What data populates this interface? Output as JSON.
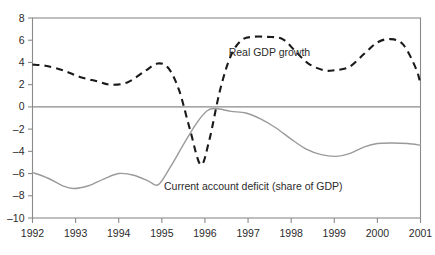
{
  "chart_data": {
    "type": "line",
    "title": "",
    "subtitle": "",
    "xlabel": "",
    "ylabel": "",
    "xlim": [
      1992,
      2001
    ],
    "ylim": [
      -10,
      8
    ],
    "grid": false,
    "legend_position": "inline-annotation",
    "y_ticks": [
      8,
      6,
      4,
      2,
      0,
      -2,
      -4,
      -6,
      -8,
      -10
    ],
    "y_tick_labels": [
      "8",
      "6",
      "4",
      "2",
      "0",
      "-2",
      "-4",
      "-6",
      "-8",
      "-10"
    ],
    "x_ticks": [
      1992,
      1993,
      1994,
      1995,
      1996,
      1997,
      1998,
      1999,
      2000,
      2001
    ],
    "x_tick_labels": [
      "1992",
      "1993",
      "1994",
      "1995",
      "1996",
      "1997",
      "1998",
      "1999",
      "2000",
      "2001"
    ],
    "zero_line": 0,
    "series": [
      {
        "name": "Real GDP growth",
        "style": "dashed",
        "color": "#1a1a1a",
        "label_position": {
          "x": 1996.55,
          "y": 4.55
        },
        "x": [
          1992.0,
          1992.3,
          1992.7,
          1993.1,
          1993.5,
          1993.8,
          1994.2,
          1994.6,
          1994.9,
          1995.15,
          1995.4,
          1995.65,
          1995.9,
          1996.1,
          1996.35,
          1996.6,
          1996.85,
          1997.1,
          1997.45,
          1997.8,
          1998.1,
          1998.4,
          1998.75,
          1999.0,
          1999.35,
          1999.7,
          2000.0,
          2000.3,
          2000.6,
          2000.9,
          2001.0
        ],
        "y": [
          3.8,
          3.7,
          3.3,
          2.7,
          2.3,
          2.0,
          2.2,
          3.2,
          3.9,
          3.5,
          1.5,
          -2.0,
          -5.2,
          -3.0,
          1.5,
          4.6,
          6.0,
          6.3,
          6.3,
          6.1,
          5.0,
          3.9,
          3.3,
          3.3,
          3.6,
          4.8,
          5.8,
          6.1,
          5.6,
          3.4,
          2.0
        ]
      },
      {
        "name": "Current account deficit (share of GDP)",
        "style": "solid",
        "color": "#9a9a9a",
        "label_position": {
          "x": 1995.05,
          "y": -7.45
        },
        "x": [
          1992.0,
          1992.35,
          1992.7,
          1992.95,
          1993.3,
          1993.65,
          1994.0,
          1994.35,
          1994.7,
          1994.92,
          1995.2,
          1995.5,
          1995.8,
          1996.05,
          1996.25,
          1996.6,
          1996.95,
          1997.3,
          1997.65,
          1998.0,
          1998.35,
          1998.7,
          1999.05,
          1999.35,
          1999.7,
          2000.0,
          2000.35,
          2000.7,
          2001.0
        ],
        "y": [
          -5.9,
          -6.4,
          -7.1,
          -7.35,
          -7.1,
          -6.5,
          -6.0,
          -6.15,
          -6.7,
          -7.0,
          -5.4,
          -3.4,
          -1.5,
          -0.35,
          -0.15,
          -0.4,
          -0.55,
          -1.1,
          -1.9,
          -2.9,
          -3.8,
          -4.3,
          -4.45,
          -4.2,
          -3.6,
          -3.3,
          -3.25,
          -3.3,
          -3.45
        ]
      }
    ]
  }
}
